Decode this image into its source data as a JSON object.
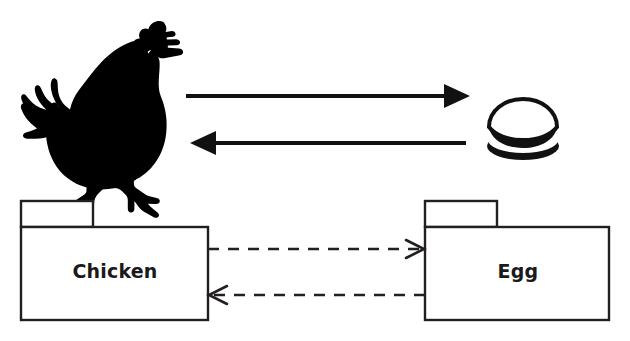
{
  "diagram": {
    "background_color": "#ffffff",
    "stroke_color": "#231f20",
    "fill_color": "#000000",
    "label_color": "#1a1a1a"
  },
  "illustrations": [
    {
      "id": "chicken-silhouette",
      "name": "chicken-silhouette",
      "kind": "silhouette",
      "subject": "chicken",
      "color": "#000000"
    },
    {
      "id": "egg-illustration",
      "name": "egg-illustration",
      "kind": "illustration",
      "subject": "egg",
      "color": "#000000"
    }
  ],
  "solid_arrows": [
    {
      "id": "arrow-chicken-to-egg",
      "name": "solid-arrow-chicken-to-egg",
      "direction": "right",
      "style": "solid",
      "head": "filled"
    },
    {
      "id": "arrow-egg-to-chicken",
      "name": "solid-arrow-egg-to-chicken",
      "direction": "left",
      "style": "solid",
      "head": "filled"
    }
  ],
  "packages": [
    {
      "id": "package-chicken",
      "name": "package-chicken",
      "label": "Chicken",
      "shape": "uml-package"
    },
    {
      "id": "package-egg",
      "name": "package-egg",
      "label": "Egg",
      "shape": "uml-package"
    }
  ],
  "dependencies": [
    {
      "id": "dependency-chicken-to-egg",
      "name": "dependency-arrow-chicken-to-egg",
      "direction": "right",
      "style": "dashed",
      "head": "open",
      "source": "Chicken",
      "target": "Egg"
    },
    {
      "id": "dependency-egg-to-chicken",
      "name": "dependency-arrow-egg-to-chicken",
      "direction": "left",
      "style": "dashed",
      "head": "open",
      "source": "Egg",
      "target": "Chicken"
    }
  ]
}
